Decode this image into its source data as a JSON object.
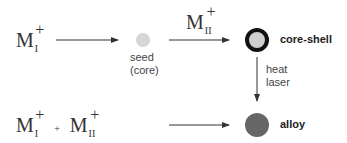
{
  "row1": {
    "reactant": {
      "base": "M",
      "subscript": "I",
      "charge": "+"
    },
    "seed_label_line1": "seed",
    "seed_label_line2": "(core)",
    "reagent": {
      "base": "M",
      "subscript": "II",
      "charge": "+"
    },
    "product_label": "core-shell"
  },
  "transform": {
    "line1": "heat",
    "line2": "laser"
  },
  "row2": {
    "reactant1": {
      "base": "M",
      "subscript": "I",
      "charge": "+"
    },
    "plus": "+",
    "reactant2": {
      "base": "M",
      "subscript": "II",
      "charge": "+"
    },
    "product_label": "alloy"
  },
  "colors": {
    "seed_fill": "#d6d6d6",
    "core_fill": "#cfcfcf",
    "shell_stroke": "#111111",
    "alloy_fill": "#666666",
    "arrow": "#333333"
  }
}
